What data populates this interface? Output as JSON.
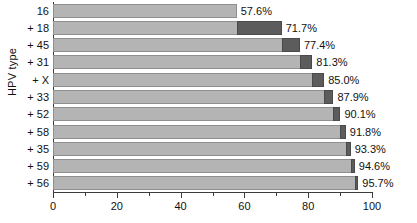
{
  "chart_data": {
    "type": "bar",
    "orientation": "horizontal",
    "stacked": true,
    "cumulative": true,
    "title": "",
    "xlabel": "",
    "ylabel": "HPV type",
    "xlim": [
      0,
      100
    ],
    "xticks": [
      0,
      20,
      40,
      60,
      80,
      100
    ],
    "xtick_labels": [
      "0",
      "20",
      "40",
      "60",
      "80",
      "100"
    ],
    "xminor_ticks": [
      10,
      30,
      50,
      70,
      90
    ],
    "grid": false,
    "legend": null,
    "categories": [
      "16",
      "+ 18",
      "+ 45",
      "+ 31",
      "+ X",
      "+ 33",
      "+ 52",
      "+ 58",
      "+ 35",
      "+ 59",
      "+ 56"
    ],
    "values": [
      57.6,
      71.7,
      77.4,
      81.3,
      85.0,
      87.9,
      90.1,
      91.8,
      93.3,
      94.6,
      95.7
    ],
    "data_labels": [
      "57.6%",
      "71.7%",
      "77.4%",
      "81.3%",
      "85.0%",
      "87.9%",
      "90.1%",
      "91.8%",
      "93.3%",
      "94.6%",
      "95.7%"
    ],
    "bars": [
      {
        "category": "16",
        "base": 0,
        "total": 57.6,
        "increment": 57.6,
        "label": "57.6%"
      },
      {
        "category": "+ 18",
        "base": 57.6,
        "total": 71.7,
        "increment": 14.1,
        "label": "71.7%"
      },
      {
        "category": "+ 45",
        "base": 71.7,
        "total": 77.4,
        "increment": 5.7,
        "label": "77.4%"
      },
      {
        "category": "+ 31",
        "base": 77.4,
        "total": 81.3,
        "increment": 3.9,
        "label": "81.3%"
      },
      {
        "category": "+ X",
        "base": 81.3,
        "total": 85.0,
        "increment": 3.7,
        "label": "85.0%"
      },
      {
        "category": "+ 33",
        "base": 85.0,
        "total": 87.9,
        "increment": 2.9,
        "label": "87.9%"
      },
      {
        "category": "+ 52",
        "base": 87.9,
        "total": 90.1,
        "increment": 2.2,
        "label": "90.1%"
      },
      {
        "category": "+ 58",
        "base": 90.1,
        "total": 91.8,
        "increment": 1.7,
        "label": "91.8%"
      },
      {
        "category": "+ 35",
        "base": 91.8,
        "total": 93.3,
        "increment": 1.5,
        "label": "93.3%"
      },
      {
        "category": "+ 59",
        "base": 93.3,
        "total": 94.6,
        "increment": 1.3,
        "label": "94.6%"
      },
      {
        "category": "+ 56",
        "base": 94.6,
        "total": 95.7,
        "increment": 1.1,
        "label": "95.7%"
      }
    ],
    "colors": {
      "cumulative_segment": "#b4b4b4",
      "increment_segment": "#5c5c5c",
      "axis": "#3b3b3b",
      "text": "#111111",
      "background": "#ffffff"
    }
  }
}
